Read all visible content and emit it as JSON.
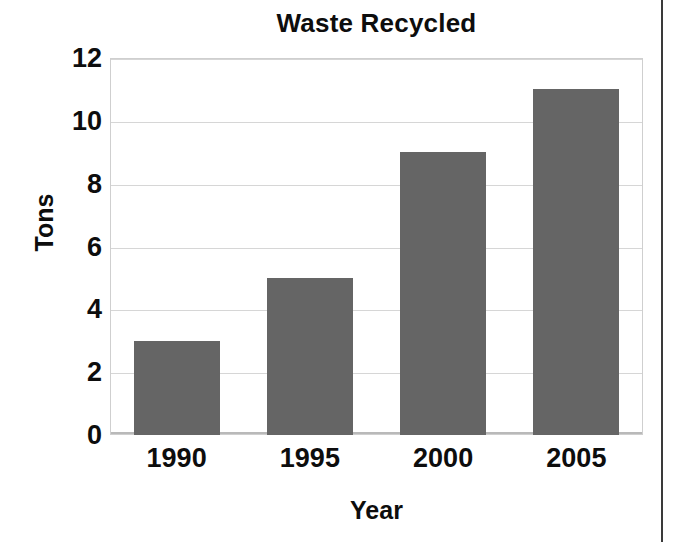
{
  "chart_data": {
    "type": "bar",
    "title": "Waste Recycled",
    "xlabel": "Year",
    "ylabel": "Tons",
    "categories": [
      "1990",
      "1995",
      "2000",
      "2005"
    ],
    "values": [
      3,
      5,
      9,
      11
    ],
    "ylim": [
      0,
      12
    ],
    "yticks": [
      0,
      2,
      4,
      6,
      8,
      10,
      12
    ],
    "ytick_labels": [
      "0",
      "2",
      "4",
      "6",
      "8",
      "10",
      "12"
    ],
    "grid": true,
    "legend": false,
    "bar_color": "#656565",
    "grid_color": "#d6d6d6",
    "background_color": "#ffffff",
    "text_color": "#0d0d0d"
  },
  "figure": {
    "title": "Waste Recycled",
    "page_edge_color": "#3a3a3a"
  }
}
